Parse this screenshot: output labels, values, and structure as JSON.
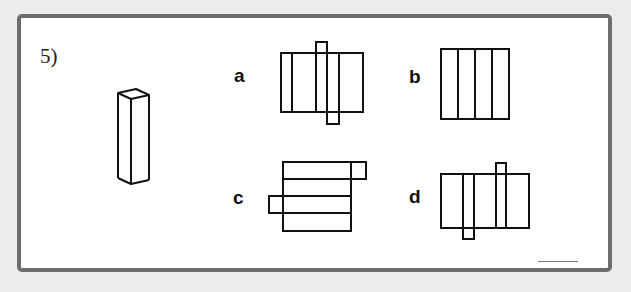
{
  "question": {
    "number": "5)"
  },
  "options": [
    {
      "label": "a"
    },
    {
      "label": "b"
    },
    {
      "label": "c"
    },
    {
      "label": "d"
    }
  ],
  "answer_blank": ""
}
